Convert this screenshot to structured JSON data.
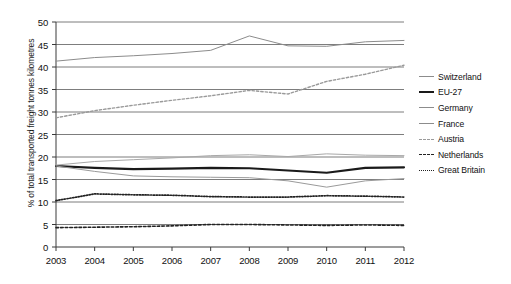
{
  "chart_data": {
    "type": "line",
    "title": "",
    "xlabel": "",
    "ylabel": "% of total transported freight tonnes kilometres",
    "categories": [
      "2003",
      "2004",
      "2005",
      "2006",
      "2007",
      "2008",
      "2009",
      "2010",
      "2011",
      "2012"
    ],
    "x": [
      2003,
      2004,
      2005,
      2006,
      2007,
      2008,
      2009,
      2010,
      2011,
      2012
    ],
    "ylim": [
      0,
      50
    ],
    "yticks": [
      0,
      5,
      10,
      15,
      20,
      25,
      30,
      35,
      40,
      45,
      50
    ],
    "grid": "horizontal",
    "legend_position": "right",
    "series": [
      {
        "name": "Switzerland",
        "style": "solid-thin",
        "color": "#8c8c8c",
        "values": [
          41.3,
          42.1,
          42.5,
          43.0,
          43.7,
          46.9,
          44.7,
          44.6,
          45.6,
          45.9
        ]
      },
      {
        "name": "EU-27",
        "style": "solid-bold",
        "color": "#1a1a1a",
        "values": [
          18.0,
          17.6,
          17.3,
          17.4,
          17.6,
          17.5,
          17.0,
          16.5,
          17.6,
          17.7
        ]
      },
      {
        "name": "Germany",
        "style": "solid-thin",
        "color": "#a8a8a8",
        "values": [
          18.2,
          19.0,
          19.4,
          19.8,
          20.3,
          20.5,
          20.1,
          20.7,
          20.4,
          20.3
        ]
      },
      {
        "name": "France",
        "style": "solid-thin",
        "color": "#9a9a9a",
        "values": [
          18.0,
          16.8,
          15.8,
          15.6,
          15.5,
          15.4,
          14.7,
          13.3,
          14.7,
          15.2
        ]
      },
      {
        "name": "Austria",
        "style": "dashed-light",
        "color": "#9a9a9a",
        "values": [
          28.7,
          30.3,
          31.5,
          32.6,
          33.6,
          34.8,
          34.0,
          36.8,
          38.4,
          40.4
        ]
      },
      {
        "name": "Netherlands",
        "style": "dashed-dark",
        "color": "#222222",
        "values": [
          4.3,
          4.4,
          4.5,
          4.7,
          5.0,
          5.0,
          4.9,
          4.8,
          4.9,
          4.8
        ]
      },
      {
        "name": "Great Britain",
        "style": "dotted",
        "color": "#222222",
        "values": [
          10.3,
          11.8,
          11.6,
          11.5,
          11.2,
          11.1,
          11.1,
          11.4,
          11.3,
          11.1
        ]
      }
    ]
  }
}
